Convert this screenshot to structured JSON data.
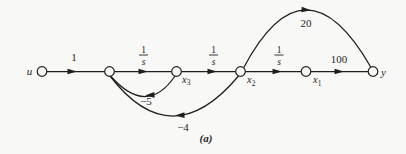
{
  "figure": {
    "kind": "signal-flow-graph",
    "caption": "(a)",
    "background_color": "#f8f8f6",
    "ink_color": "#1f1f1f"
  },
  "diagram": {
    "nodes": [
      {
        "id": "u",
        "label": "u"
      },
      {
        "id": "sum",
        "label": ""
      },
      {
        "id": "x3",
        "label": "x",
        "sub": "3"
      },
      {
        "id": "x2",
        "label": "x",
        "sub": "2"
      },
      {
        "id": "x1",
        "label": "x",
        "sub": "1"
      },
      {
        "id": "y",
        "label": "y"
      }
    ],
    "edges": [
      {
        "from": "u",
        "to": "sum",
        "gain": "1"
      },
      {
        "from": "sum",
        "to": "x3",
        "gain": "1/s",
        "num": "1",
        "den": "s"
      },
      {
        "from": "x3",
        "to": "x2",
        "gain": "1/s",
        "num": "1",
        "den": "s"
      },
      {
        "from": "x2",
        "to": "x1",
        "gain": "1/s",
        "num": "1",
        "den": "s"
      },
      {
        "from": "x1",
        "to": "y",
        "gain": "100"
      },
      {
        "from": "x2",
        "to": "y",
        "gain": "20"
      },
      {
        "from": "x3",
        "to": "sum",
        "gain": "−5"
      },
      {
        "from": "x2",
        "to": "sum",
        "gain": "−4"
      }
    ]
  }
}
